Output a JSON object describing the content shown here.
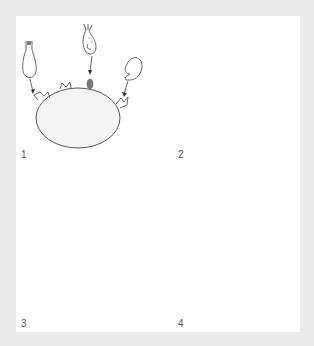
{
  "figure": {
    "title": "",
    "background_color": "#ebebeb",
    "panel_color": "#ffffff",
    "ink_color": "#444444",
    "granule_color": "#7a7a7a",
    "panels": [
      {
        "id": "1",
        "label": "1",
        "description": "Three types of immune effectors approach receptor sites on the target cell surface"
      },
      {
        "id": "2",
        "label": "2",
        "description": "Receptor sites on target cell surface become bound, gray bulbs protrude around membrane"
      },
      {
        "id": "3",
        "label": "3",
        "description": "Multiple immune cells dock onto the target cell via bound receptors"
      },
      {
        "id": "4",
        "label": "4",
        "description": "Target cell degranulates, releasing gray granules outward"
      }
    ]
  }
}
